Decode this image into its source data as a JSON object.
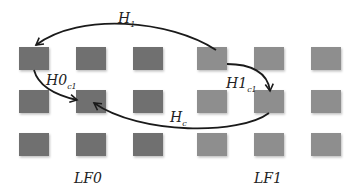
{
  "diagram": {
    "colors": {
      "lf0_square": "#6f6f6f",
      "lf1_square": "#8e8e8e",
      "arrow": "#1a1a1a"
    },
    "groups": [
      {
        "id": "lf0",
        "label": "LF0",
        "rows": 3,
        "cols": 3
      },
      {
        "id": "lf1",
        "label": "LF1",
        "rows": 3,
        "cols": 3
      }
    ],
    "arrows": [
      {
        "id": "h1",
        "label_main": "H",
        "label_sub": "1",
        "from": "lf1 r0c0",
        "to": "lf0 r0c0"
      },
      {
        "id": "h0c1",
        "label_main": "H0",
        "label_sub": "c1",
        "from": "lf0 r0c0",
        "to": "lf0 r1c1"
      },
      {
        "id": "h1c1",
        "label_main": "H1",
        "label_sub": "c1",
        "from": "lf1 r0c0",
        "to": "lf1 r1c1"
      },
      {
        "id": "hc",
        "label_main": "H",
        "label_sub": "c",
        "from": "lf1 r1c1",
        "to": "lf0 r1c1"
      }
    ]
  }
}
